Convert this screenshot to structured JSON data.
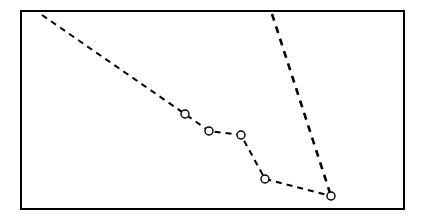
{
  "figure": {
    "title": "",
    "background_color": "#ffffff",
    "width": 425,
    "height": 224
  },
  "frame": {
    "name": "plot-border",
    "x": 21,
    "y": 11,
    "width": 383,
    "height": 198,
    "stroke_color": "#000000",
    "stroke_width": 2,
    "fill": "none"
  },
  "chart_data": {
    "type": "line",
    "title": "",
    "xlabel": "",
    "ylabel": "",
    "xlim": [
      21,
      404
    ],
    "ylim": [
      11,
      209
    ],
    "grid": false,
    "legend": "none",
    "axis_ticks_visible": false,
    "axis_labels_visible": false,
    "note": "Pixel-space coordinates; y increases downward as drawn.",
    "series": [
      {
        "name": "series-1-markered-descending",
        "style": "dashed",
        "color": "#000000",
        "line_width": 2,
        "dash_pattern": "6 5",
        "marker": "circle-open",
        "marker_radius": 4,
        "marker_stroke_width": 1.4,
        "markers_on_all_points": false,
        "points": [
          {
            "label": "p0",
            "x": 42,
            "y": 15,
            "marker": false
          },
          {
            "label": "p1",
            "x": 185,
            "y": 114,
            "marker": true
          },
          {
            "label": "p2",
            "x": 209,
            "y": 131,
            "marker": true
          },
          {
            "label": "p3",
            "x": 241,
            "y": 135,
            "marker": true
          },
          {
            "label": "p4",
            "x": 265,
            "y": 179,
            "marker": true
          },
          {
            "label": "p5",
            "x": 331,
            "y": 196,
            "marker": true
          }
        ]
      },
      {
        "name": "series-2-steep-descending",
        "style": "dashed",
        "color": "#000000",
        "line_width": 2.6,
        "dash_pattern": "7 6",
        "marker": "none",
        "points": [
          {
            "label": "q0",
            "x": 272,
            "y": 14,
            "marker": false
          },
          {
            "label": "q1",
            "x": 331,
            "y": 196,
            "marker": false
          }
        ]
      }
    ]
  }
}
